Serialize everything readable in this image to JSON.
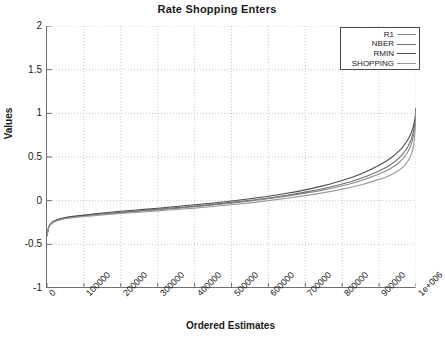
{
  "chart_data": {
    "type": "line",
    "title": "Rate Shopping Enters",
    "xlabel": "Ordered Estimates",
    "ylabel": "Values",
    "grid": true,
    "legend_position": "top-right",
    "xlim": [
      0,
      1000000
    ],
    "ylim": [
      -1,
      2
    ],
    "xticks": [
      0,
      100000,
      200000,
      300000,
      400000,
      500000,
      600000,
      700000,
      800000,
      900000,
      1000000
    ],
    "xtick_labels": [
      "0",
      "100000",
      "200000",
      "300000",
      "400000",
      "500000",
      "600000",
      "700000",
      "800000",
      "900000",
      "1e+006"
    ],
    "yticks": [
      -1,
      -0.5,
      0,
      0.5,
      1,
      1.5,
      2
    ],
    "ytick_labels": [
      "-1",
      "-0.5",
      "0",
      "0.5",
      "1",
      "1.5",
      "2"
    ],
    "x": [
      0,
      5000,
      12000,
      25000,
      50000,
      100000,
      150000,
      200000,
      250000,
      300000,
      350000,
      400000,
      450000,
      500000,
      550000,
      600000,
      650000,
      700000,
      750000,
      800000,
      850000,
      900000,
      930000,
      955000,
      972000,
      985000,
      993000,
      997000,
      999000,
      1000000
    ],
    "series": [
      {
        "name": "R1",
        "color": "#8a8a8a",
        "values": [
          -0.4,
          -0.3,
          -0.26,
          -0.23,
          -0.2,
          -0.175,
          -0.155,
          -0.138,
          -0.122,
          -0.105,
          -0.088,
          -0.07,
          -0.05,
          -0.028,
          -0.004,
          0.022,
          0.052,
          0.086,
          0.124,
          0.17,
          0.228,
          0.305,
          0.365,
          0.44,
          0.52,
          0.62,
          0.74,
          0.86,
          0.96,
          1.05
        ]
      },
      {
        "name": "NBER",
        "color": "#707070",
        "values": [
          -0.4,
          -0.3,
          -0.26,
          -0.228,
          -0.198,
          -0.172,
          -0.15,
          -0.132,
          -0.115,
          -0.098,
          -0.08,
          -0.062,
          -0.042,
          -0.02,
          0.004,
          0.03,
          0.062,
          0.098,
          0.14,
          0.19,
          0.254,
          0.34,
          0.408,
          0.492,
          0.578,
          0.678,
          0.79,
          0.895,
          0.985,
          1.055
        ]
      },
      {
        "name": "RMIN",
        "color": "#4d4d4d",
        "values": [
          -0.4,
          -0.298,
          -0.256,
          -0.222,
          -0.192,
          -0.165,
          -0.142,
          -0.122,
          -0.104,
          -0.086,
          -0.067,
          -0.047,
          -0.026,
          -0.003,
          0.022,
          0.05,
          0.084,
          0.124,
          0.172,
          0.23,
          0.305,
          0.405,
          0.482,
          0.572,
          0.66,
          0.755,
          0.855,
          0.935,
          1.0,
          1.055
        ]
      },
      {
        "name": "SHOPPING",
        "color": "#9a9a9a",
        "values": [
          -0.4,
          -0.302,
          -0.264,
          -0.234,
          -0.206,
          -0.182,
          -0.163,
          -0.147,
          -0.132,
          -0.117,
          -0.101,
          -0.085,
          -0.067,
          -0.047,
          -0.025,
          0.0,
          0.028,
          0.058,
          0.092,
          0.132,
          0.18,
          0.244,
          0.292,
          0.352,
          0.418,
          0.505,
          0.625,
          0.775,
          0.92,
          1.045
        ]
      }
    ]
  },
  "legend": {
    "entries": [
      {
        "label": "R1"
      },
      {
        "label": "NBER"
      },
      {
        "label": "RMIN"
      },
      {
        "label": "SHOPPING"
      }
    ]
  },
  "colors": {
    "axis": "#6e6e6e",
    "grid": "#b9b9b9",
    "text": "#1a1a1a",
    "background": "#ffffff"
  }
}
